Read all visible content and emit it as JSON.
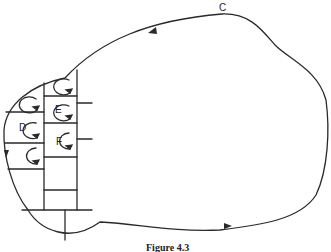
{
  "figure": {
    "caption": "Figure 4.3",
    "contour_label": "C",
    "cell_labels": {
      "d": "D",
      "e": "E",
      "f": "F"
    }
  }
}
